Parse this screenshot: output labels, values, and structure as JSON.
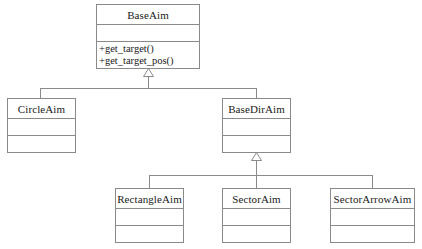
{
  "diagram": {
    "type": "uml-class-diagram",
    "colors": {
      "background": "#ffffff",
      "border": "#8a8a8a",
      "text": "#1a1a1a",
      "line": "#8a8a8a"
    }
  },
  "classes": {
    "base_aim": {
      "name": "BaseAim",
      "operations": [
        "+get_target()",
        "+get_target_pos()"
      ]
    },
    "circle_aim": {
      "name": "CircleAim",
      "operations": []
    },
    "base_dir_aim": {
      "name": "BaseDirAim",
      "operations": []
    },
    "rectangle_aim": {
      "name": "RectangleAim",
      "operations": []
    },
    "sector_aim": {
      "name": "SectorAim",
      "operations": []
    },
    "sector_arrow_aim": {
      "name": "SectorArrowAim",
      "operations": []
    }
  },
  "relations": [
    {
      "from": "CircleAim",
      "to": "BaseAim",
      "kind": "generalization"
    },
    {
      "from": "BaseDirAim",
      "to": "BaseAim",
      "kind": "generalization"
    },
    {
      "from": "RectangleAim",
      "to": "BaseDirAim",
      "kind": "generalization"
    },
    {
      "from": "SectorAim",
      "to": "BaseDirAim",
      "kind": "generalization"
    },
    {
      "from": "SectorArrowAim",
      "to": "BaseDirAim",
      "kind": "generalization"
    }
  ]
}
